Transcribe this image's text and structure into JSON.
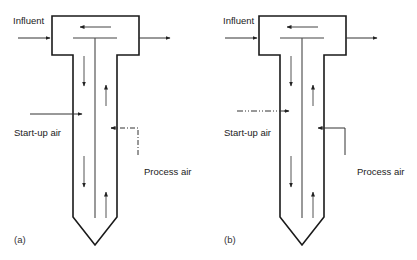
{
  "figure": {
    "panels": [
      {
        "id": "a",
        "panel_label": "(a)",
        "influent_label": "Influent",
        "startup_air_label": "Start-up air",
        "process_air_label": "Process air",
        "startup_air_line": "solid",
        "process_air_line": "dash-dot"
      },
      {
        "id": "b",
        "panel_label": "(b)",
        "influent_label": "Influent",
        "startup_air_label": "Start-up air",
        "process_air_label": "Process air",
        "startup_air_line": "dash-dot",
        "process_air_line": "solid"
      }
    ],
    "colors": {
      "outline": "#1a1a1a",
      "flow_arrow": "#444444",
      "text": "#222222"
    }
  }
}
